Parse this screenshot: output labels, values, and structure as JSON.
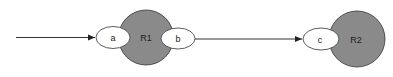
{
  "diagram": {
    "colors": {
      "region_fill": "#8a8a8a",
      "port_fill": "#ffffff",
      "stroke": "#333333",
      "background": "#ffffff"
    },
    "regions": [
      {
        "id": "R1",
        "label": "R1"
      },
      {
        "id": "R2",
        "label": "R2"
      }
    ],
    "ports": [
      {
        "id": "a",
        "label": "a",
        "region": "R1",
        "side": "left"
      },
      {
        "id": "b",
        "label": "b",
        "region": "R1",
        "side": "right"
      },
      {
        "id": "c",
        "label": "c",
        "region": "R2",
        "side": "left"
      }
    ],
    "edges": [
      {
        "from": "external",
        "to": "a"
      },
      {
        "from": "b",
        "to": "c"
      }
    ]
  }
}
